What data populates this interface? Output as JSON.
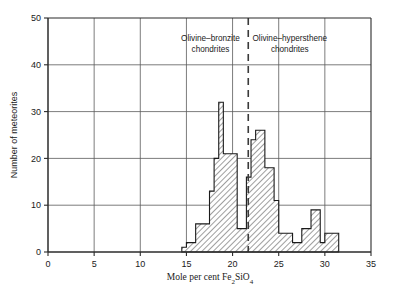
{
  "chart_data": {
    "type": "bar",
    "title": "",
    "subtitle": "",
    "xlabel": "Mole per cent Fe2SiO4",
    "xlabel_parts": {
      "pre": "Mole per cent Fe",
      "sub1": "2",
      "mid": "SiO",
      "sub2": "4"
    },
    "ylabel": "Number of meteorites",
    "xlim": [
      0,
      35
    ],
    "ylim": [
      0,
      50
    ],
    "xticks": [
      "0",
      "5",
      "10",
      "15",
      "20",
      "25",
      "30",
      "35"
    ],
    "xtick_values": [
      0,
      5,
      10,
      15,
      20,
      25,
      30,
      35
    ],
    "yticks": [
      "0",
      "10",
      "20",
      "30",
      "40",
      "50"
    ],
    "ytick_values": [
      0,
      10,
      20,
      30,
      40,
      50
    ],
    "grid": true,
    "legend": "none",
    "bin_width": 0.5,
    "bin_edges": [
      14.5,
      15.0,
      15.5,
      16.0,
      16.5,
      17.0,
      17.5,
      18.0,
      18.5,
      19.0,
      19.5,
      20.0,
      20.5,
      21.0,
      21.5,
      22.0,
      22.5,
      23.0,
      23.5,
      24.0,
      24.5,
      25.0,
      25.5,
      26.0,
      26.5,
      27.0,
      27.5,
      28.0,
      28.5,
      29.0,
      29.5,
      30.0,
      30.5,
      31.0,
      31.5
    ],
    "values": [
      1,
      2,
      2,
      6,
      6,
      6,
      13,
      20,
      32,
      21,
      21,
      21,
      5,
      5,
      16,
      24,
      26,
      18,
      18,
      11,
      11,
      4,
      4,
      4,
      2,
      2,
      5,
      5,
      9,
      9,
      2,
      4,
      4,
      4
    ],
    "bars": [
      {
        "x0": 14.5,
        "x1": 15.0,
        "y": 1
      },
      {
        "x0": 15.0,
        "x1": 15.5,
        "y": 2
      },
      {
        "x0": 15.5,
        "x1": 16.0,
        "y": 2
      },
      {
        "x0": 16.0,
        "x1": 17.5,
        "y": 6
      },
      {
        "x0": 17.5,
        "x1": 18.0,
        "y": 13
      },
      {
        "x0": 18.0,
        "x1": 18.5,
        "y": 20
      },
      {
        "x0": 18.5,
        "x1": 19.0,
        "y": 32
      },
      {
        "x0": 19.0,
        "x1": 20.5,
        "y": 21
      },
      {
        "x0": 20.5,
        "x1": 21.5,
        "y": 5
      },
      {
        "x0": 21.5,
        "x1": 22.0,
        "y": 16
      },
      {
        "x0": 22.0,
        "x1": 22.5,
        "y": 24
      },
      {
        "x0": 22.5,
        "x1": 23.5,
        "y": 26
      },
      {
        "x0": 23.5,
        "x1": 24.5,
        "y": 18
      },
      {
        "x0": 24.5,
        "x1": 25.0,
        "y": 11
      },
      {
        "x0": 25.0,
        "x1": 26.5,
        "y": 4
      },
      {
        "x0": 26.5,
        "x1": 27.5,
        "y": 2
      },
      {
        "x0": 27.5,
        "x1": 28.5,
        "y": 5
      },
      {
        "x0": 28.5,
        "x1": 29.5,
        "y": 9
      },
      {
        "x0": 29.5,
        "x1": 30.0,
        "y": 2
      },
      {
        "x0": 30.0,
        "x1": 31.5,
        "y": 4
      }
    ],
    "divider": {
      "x": 21.7,
      "style": "dashed"
    },
    "annotations": [
      {
        "id": "left-group",
        "line1": "Olivine–bronzite",
        "line2": "chondrites",
        "x": 17.6,
        "y": 45
      },
      {
        "id": "right-group",
        "line1": "Olivine–hypersthene",
        "line2": "chondrites",
        "x": 26.2,
        "y": 45
      }
    ],
    "colors": {
      "axis": "#2b2b2b",
      "grid": "#5a5a5a",
      "bar_outline": "#1a1a1a",
      "bar_fill": "#b9b9b9",
      "background": "#ffffff",
      "divider": "#3a3a3a"
    }
  }
}
